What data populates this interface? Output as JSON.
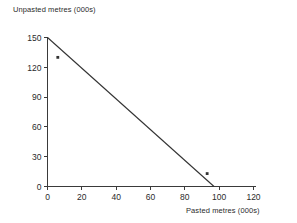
{
  "chart_data": {
    "type": "line",
    "title": "",
    "subtitle": "",
    "xlabel": "Pasted metres (000s)",
    "ylabel": "Unpasted metres (000s)",
    "xlim": [
      0,
      120
    ],
    "ylim": [
      0,
      150
    ],
    "xticks": [
      0,
      20,
      40,
      60,
      80,
      100,
      120
    ],
    "yticks": [
      0,
      30,
      60,
      90,
      120,
      150
    ],
    "xtick_labels": [
      "0",
      "20",
      "40",
      "60",
      "80",
      "100",
      "120"
    ],
    "ytick_labels": [
      "0",
      "30",
      "60",
      "90",
      "120",
      "150"
    ],
    "grid": false,
    "legend": null,
    "series": [
      {
        "name": "constraint-line",
        "kind": "line",
        "x": [
          0,
          97
        ],
        "y": [
          150,
          0
        ],
        "color": "#333333",
        "linewidth": 1
      },
      {
        "name": "markers",
        "kind": "scatter",
        "points": [
          {
            "x": 6,
            "y": 130
          },
          {
            "x": 93,
            "y": 13
          }
        ],
        "color": "#333333",
        "marker": "square"
      }
    ],
    "annotations": []
  },
  "axes": {
    "x_axis_label": "Pasted metres (000s)",
    "y_axis_label": "Unpasted metres (000s)"
  }
}
